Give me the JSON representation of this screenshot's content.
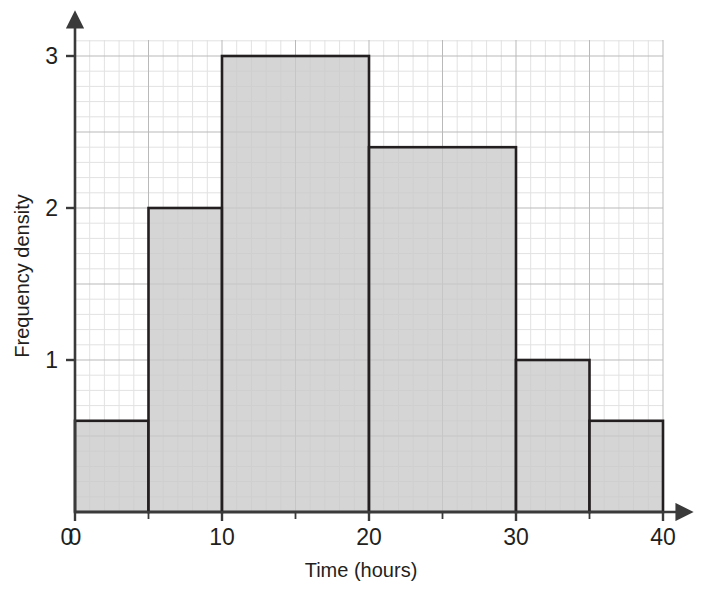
{
  "chart_data": {
    "type": "bar",
    "title": "",
    "xlabel": "Time (hours)",
    "ylabel": "Frequency density",
    "xlim": [
      0,
      40
    ],
    "ylim": [
      0,
      3.2
    ],
    "grid": true,
    "legend": "none",
    "x_ticks_major": [
      0,
      10,
      20,
      30,
      40
    ],
    "x_ticks_major_labels": [
      "0",
      "10",
      "20",
      "30",
      "40"
    ],
    "x_ticks_minor": [
      5,
      15,
      25,
      35
    ],
    "y_ticks_major": [
      0,
      1,
      2,
      3
    ],
    "y_ticks_major_labels": [
      "0",
      "1",
      "2",
      "3"
    ],
    "bins": [
      {
        "label": "0-5",
        "x_start": 0,
        "x_end": 5,
        "value": 0.6
      },
      {
        "label": "5-10",
        "x_start": 5,
        "x_end": 10,
        "value": 2.0
      },
      {
        "label": "10-20",
        "x_start": 10,
        "x_end": 20,
        "value": 3.0
      },
      {
        "label": "20-30",
        "x_start": 20,
        "x_end": 30,
        "value": 2.4
      },
      {
        "label": "30-35",
        "x_start": 30,
        "x_end": 35,
        "value": 1.0
      },
      {
        "label": "35-40",
        "x_start": 35,
        "x_end": 40,
        "value": 0.6
      }
    ],
    "categories": [
      "0-5",
      "5-10",
      "10-20",
      "20-30",
      "30-35",
      "35-40"
    ],
    "values": [
      0.6,
      2.0,
      3.0,
      2.4,
      1.0,
      0.6
    ],
    "bar_fill_color": "#c9c9c9",
    "bar_edge_color": "#231f20",
    "grid_major_color": "#b9b9b9",
    "grid_minor_color": "#dedede",
    "axis_color": "#3a3a3a"
  }
}
